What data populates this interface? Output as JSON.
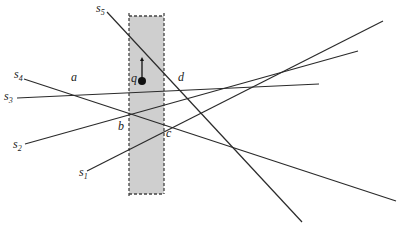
{
  "diagram": {
    "strip": {
      "x1": 129,
      "x2": 164,
      "y1": 16,
      "y2": 194,
      "fill": "#cfcfcf",
      "border": "#444444"
    },
    "point": {
      "label": "q",
      "x": 142,
      "y": 81,
      "arrow_to_y": 57
    },
    "segments": [
      {
        "name": "s1",
        "label": "s",
        "sub": "1",
        "x1": 87,
        "y1": 171,
        "x2": 383,
        "y2": 21,
        "lx": 79,
        "ly": 176
      },
      {
        "name": "s2",
        "label": "s",
        "sub": "2",
        "x1": 25,
        "y1": 144,
        "x2": 358,
        "y2": 51,
        "lx": 13,
        "ly": 148
      },
      {
        "name": "s3",
        "label": "s",
        "sub": "3",
        "x1": 17,
        "y1": 98,
        "x2": 319,
        "y2": 84,
        "lx": 4,
        "ly": 100
      },
      {
        "name": "s4",
        "label": "s",
        "sub": "4",
        "x1": 24,
        "y1": 79,
        "x2": 396,
        "y2": 201,
        "lx": 14,
        "ly": 78
      },
      {
        "name": "s5",
        "label": "s",
        "sub": "5",
        "x1": 107,
        "y1": 12,
        "x2": 302,
        "y2": 222,
        "lx": 96,
        "ly": 12
      }
    ],
    "region_labels": [
      {
        "text": "a",
        "x": 71,
        "y": 81
      },
      {
        "text": "b",
        "x": 118,
        "y": 130
      },
      {
        "text": "c",
        "x": 166,
        "y": 137
      },
      {
        "text": "d",
        "x": 178,
        "y": 81
      }
    ]
  }
}
